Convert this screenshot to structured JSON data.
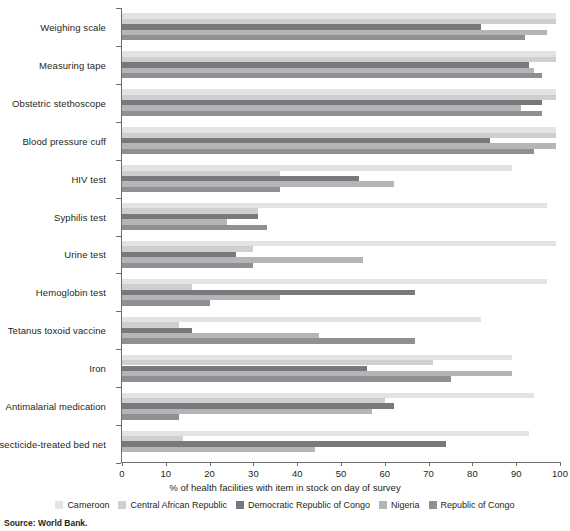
{
  "chart_data": {
    "type": "bar",
    "orientation": "horizontal",
    "grouped": true,
    "title": "",
    "xlabel": "% of health facilities with item in stock on day of survey",
    "ylabel": "",
    "xlim": [
      0,
      100
    ],
    "xticks": [
      0,
      10,
      20,
      30,
      40,
      50,
      60,
      70,
      80,
      90,
      100
    ],
    "grid": false,
    "legend_position": "bottom",
    "categories": [
      "Weighing scale",
      "Measuring tape",
      "Obstetric stethoscope",
      "Blood pressure cuff",
      "HIV test",
      "Syphilis test",
      "Urine test",
      "Hemoglobin test",
      "Tetanus toxoid vaccine",
      "Iron",
      "Antimalarial medication",
      "Insecticide-treated bed net"
    ],
    "series": [
      {
        "name": "Cameroon",
        "color": "#e3e3e3",
        "values": [
          99,
          99,
          99,
          99,
          89,
          97,
          99,
          97,
          82,
          89,
          94,
          93
        ]
      },
      {
        "name": "Central African Republic",
        "color": "#cfcfcf",
        "values": [
          99,
          99,
          99,
          99,
          36,
          31,
          30,
          16,
          13,
          71,
          60,
          14
        ]
      },
      {
        "name": "Democratic Republic of Congo",
        "color": "#77797c",
        "values": [
          82,
          93,
          96,
          84,
          54,
          31,
          26,
          67,
          16,
          56,
          62,
          74
        ]
      },
      {
        "name": "Nigeria",
        "color": "#b3b5b7",
        "values": [
          97,
          94,
          91,
          99,
          62,
          24,
          55,
          36,
          45,
          89,
          57,
          44
        ]
      },
      {
        "name": "Republic of Congo",
        "color": "#8e9093",
        "values": [
          92,
          96,
          96,
          94,
          36,
          33,
          30,
          20,
          67,
          75,
          13,
          0
        ]
      }
    ]
  },
  "source": {
    "text": "Source: World Bank."
  }
}
